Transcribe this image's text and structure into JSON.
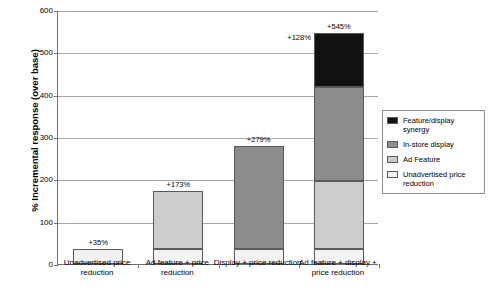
{
  "chart_data": {
    "type": "bar",
    "title": "",
    "subtitle": "",
    "xlabel": "",
    "ylabel": "% Incremental response (over base)",
    "ylim": [
      0,
      600
    ],
    "ytick_values": [
      0,
      100,
      200,
      300,
      400,
      500,
      600
    ],
    "ytick_labels": [
      "0",
      "100",
      "200",
      "300",
      "400",
      "500",
      "600"
    ],
    "grid": "horizontal",
    "stacked": true,
    "legend_position": "right",
    "categories": [
      "Unadvertised price reduction",
      "Ad feature + price reduction",
      "Display + price reduction",
      "Ad feature + display + price reduction"
    ],
    "series": [
      {
        "name": "Unadvertised price reduction",
        "color": "#f2f2f2",
        "values": [
          35,
          35,
          35,
          35
        ]
      },
      {
        "name": "Ad Feature",
        "color": "#cccccc",
        "values": [
          0,
          138,
          0,
          160
        ]
      },
      {
        "name": "In-store display",
        "color": "#8c8c8c",
        "values": [
          0,
          0,
          244,
          222
        ]
      },
      {
        "name": "Feature/display synergy",
        "color": "#111111",
        "values": [
          0,
          0,
          0,
          128
        ]
      }
    ],
    "totals": [
      35,
      173,
      279,
      545
    ],
    "total_labels": [
      "+35%",
      "+173%",
      "+279%",
      "+545%"
    ],
    "annotations": [
      {
        "text": "+128%",
        "series": "Feature/display synergy",
        "category_index": 3
      }
    ],
    "legend_entries": [
      "Feature/display synergy",
      "In-store display",
      "Ad Feature",
      "Unadvertised price reduction"
    ]
  },
  "axis": {
    "y_title": "% Incremental response (over base)"
  },
  "colors": {
    "synergy": "#111111",
    "display": "#8c8c8c",
    "feature": "#cccccc",
    "price": "#f2f2f2",
    "gridline": "#a8a8a8",
    "axis": "#6f6f6f",
    "bar_outline": "#5a5a5a"
  }
}
